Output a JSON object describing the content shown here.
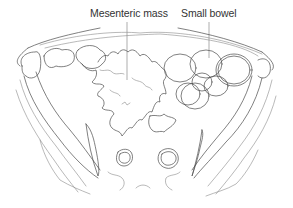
{
  "labels": {
    "mesenteric_mass": "Mesenteric mass",
    "small_bowel": "Small bowel"
  },
  "colors": {
    "line": "#4a4a4a",
    "light_line": "#8a8a8a",
    "text": "#333333",
    "background": "#ffffff"
  }
}
